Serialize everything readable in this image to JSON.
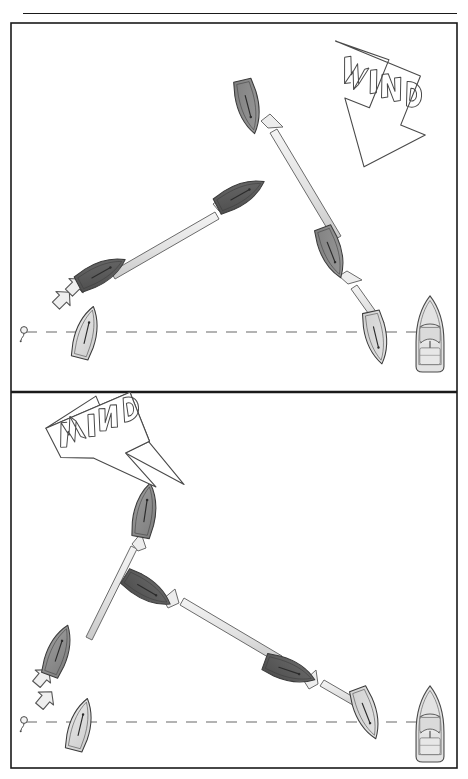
{
  "page": {
    "header_rule": true,
    "cropped_caption_text": ""
  },
  "colors": {
    "ink": "#1a1a1a",
    "outline": "#4a4a4a",
    "boat_dark": "#585858",
    "boat_mid": "#8c8c8c",
    "boat_light": "#dcdcdc",
    "arrow_fill": "#e8e8e8",
    "arrow_stroke": "#6b6b6b",
    "dash_line": "#9a9a9a",
    "page_bg": "#ffffff",
    "panel_border": "#1a1a1a"
  },
  "panels": [
    {
      "id": "panel-top",
      "name": "upper-diagram",
      "wind": {
        "label": "WIND",
        "direction": "down-left",
        "angle_deg": 215
      },
      "start_line": {
        "style": "dashed",
        "y": 332,
        "from_x": 30,
        "to_x": 430
      },
      "buoy": {
        "name": "pin-end-buoy",
        "x": 24,
        "y": 332
      },
      "committee_boat": {
        "name": "committee-motorboat",
        "x": 430,
        "y": 333,
        "heading": "bow-up"
      },
      "boats": [
        {
          "id": "t1",
          "shade": "light",
          "x": 86,
          "y": 334,
          "angle": 15,
          "label": "start-boat"
        },
        {
          "id": "t2",
          "shade": "dark",
          "x": 99,
          "y": 272,
          "angle": 60,
          "label": "after-tack-port"
        },
        {
          "id": "t3",
          "shade": "dark",
          "x": 237,
          "y": 194,
          "angle": 60,
          "label": "upwind-port"
        },
        {
          "id": "t4",
          "shade": "mid",
          "x": 247,
          "y": 105,
          "angle": 166,
          "label": "windward-mark-approach"
        },
        {
          "id": "t5",
          "shade": "mid",
          "x": 330,
          "y": 250,
          "angle": 161,
          "label": "upwind-starboard"
        },
        {
          "id": "t6",
          "shade": "light",
          "x": 375,
          "y": 335,
          "angle": 168,
          "label": "start-boat-right"
        }
      ],
      "track_arrows": [
        {
          "from": [
            381,
            328
          ],
          "to": [
            344,
            278
          ],
          "name": "arrow-right-start-to-upwind"
        },
        {
          "from": [
            332,
            236
          ],
          "to": [
            266,
            124
          ],
          "name": "arrow-upwind-starboard-to-mark"
        },
        {
          "from": [
            114,
            265
          ],
          "to": [
            221,
            203
          ],
          "name": "arrow-port-tack-long-leg"
        }
      ],
      "small_arrows": [
        {
          "name": "small-arrow-lower",
          "x": 60,
          "y": 296,
          "angle": 45
        },
        {
          "name": "small-arrow-upper",
          "x": 72,
          "y": 285,
          "angle": 45
        }
      ]
    },
    {
      "id": "panel-bottom",
      "name": "lower-diagram",
      "wind": {
        "label": "WIND",
        "direction": "down-right",
        "angle_deg": 325
      },
      "start_line": {
        "style": "dashed",
        "y": 722,
        "from_x": 30,
        "to_x": 430
      },
      "buoy": {
        "name": "pin-end-buoy",
        "x": 24,
        "y": 722
      },
      "committee_boat": {
        "name": "committee-motorboat",
        "x": 430,
        "y": 723,
        "heading": "bow-up"
      },
      "boats": [
        {
          "id": "b1",
          "shade": "light",
          "x": 80,
          "y": 724,
          "angle": 15,
          "label": "start-boat"
        },
        {
          "id": "b2",
          "shade": "mid",
          "x": 58,
          "y": 650,
          "angle": 20,
          "label": "after-tack"
        },
        {
          "id": "b3",
          "shade": "mid",
          "x": 145,
          "y": 510,
          "angle": 10,
          "label": "windward-reach"
        },
        {
          "id": "b4",
          "shade": "dark",
          "x": 145,
          "y": 587,
          "angle": 120,
          "label": "cross-boat-dark"
        },
        {
          "id": "b5",
          "shade": "dark",
          "x": 287,
          "y": 668,
          "angle": 110,
          "label": "downwind-dark"
        },
        {
          "id": "b6",
          "shade": "light",
          "x": 365,
          "y": 710,
          "angle": 160,
          "label": "start-boat-right"
        }
      ],
      "track_arrows": [
        {
          "from": [
            362,
            702
          ],
          "to": [
            310,
            675
          ],
          "name": "arrow-right-start"
        },
        {
          "from": [
            268,
            655
          ],
          "to": [
            168,
            595
          ],
          "name": "arrow-long-cross-leg"
        },
        {
          "from": [
            92,
            628
          ],
          "to": [
            140,
            538
          ],
          "name": "arrow-up-leg"
        }
      ],
      "small_arrows": [
        {
          "name": "small-arrow-lower",
          "x": 44,
          "y": 697,
          "angle": 50
        },
        {
          "name": "small-arrow-upper",
          "x": 42,
          "y": 678,
          "angle": 50
        }
      ]
    }
  ],
  "divider": {
    "name": "panel-divider-rule",
    "y": 392
  },
  "frame": {
    "left": 11,
    "top": 23,
    "right": 457,
    "bottom": 768
  }
}
